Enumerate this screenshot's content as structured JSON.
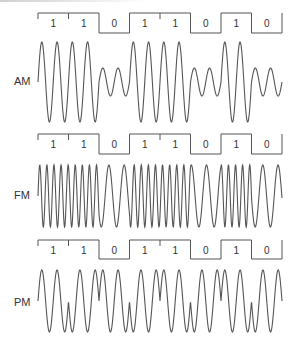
{
  "diagram": {
    "bits": [
      1,
      1,
      0,
      1,
      1,
      0,
      1,
      0
    ],
    "stroke_color": "#555555",
    "panels": [
      {
        "id": "am",
        "label": "AM",
        "description": "Amplitude modulation: high amplitude for 1, low amplitude for 0",
        "header_top": 13,
        "header_low": 33,
        "wave_center": 82,
        "wave_amp_high": 40,
        "wave_amp_low": 14,
        "label_y": 82
      },
      {
        "id": "fm",
        "label": "FM",
        "description": "Frequency modulation: high frequency for 1, low frequency for 0",
        "header_top": 134,
        "header_low": 154,
        "wave_center": 196,
        "wave_amp": 31,
        "label_y": 196
      },
      {
        "id": "pm",
        "label": "PM",
        "description": "Phase modulation: phase shift at each bit transition",
        "header_top": 240,
        "header_low": 259,
        "wave_center": 301,
        "wave_amp": 31,
        "label_y": 303
      }
    ],
    "x_start": 38,
    "bit_width": 30.5
  }
}
